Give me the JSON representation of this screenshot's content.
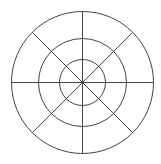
{
  "diagram": {
    "type": "concentric-circles-with-radial-spokes",
    "center": {
      "x": 82.5,
      "y": 82.5
    },
    "rings": [
      {
        "name": "inner",
        "radius": 23
      },
      {
        "name": "middle",
        "radius": 44
      },
      {
        "name": "outer",
        "radius": 71
      }
    ],
    "spokes": {
      "count": 8,
      "angles_deg": [
        0,
        45,
        90,
        135,
        180,
        225,
        270,
        315
      ],
      "length": 71
    },
    "stroke_color": "#444444",
    "stroke_width": 1,
    "background": "#ffffff"
  }
}
